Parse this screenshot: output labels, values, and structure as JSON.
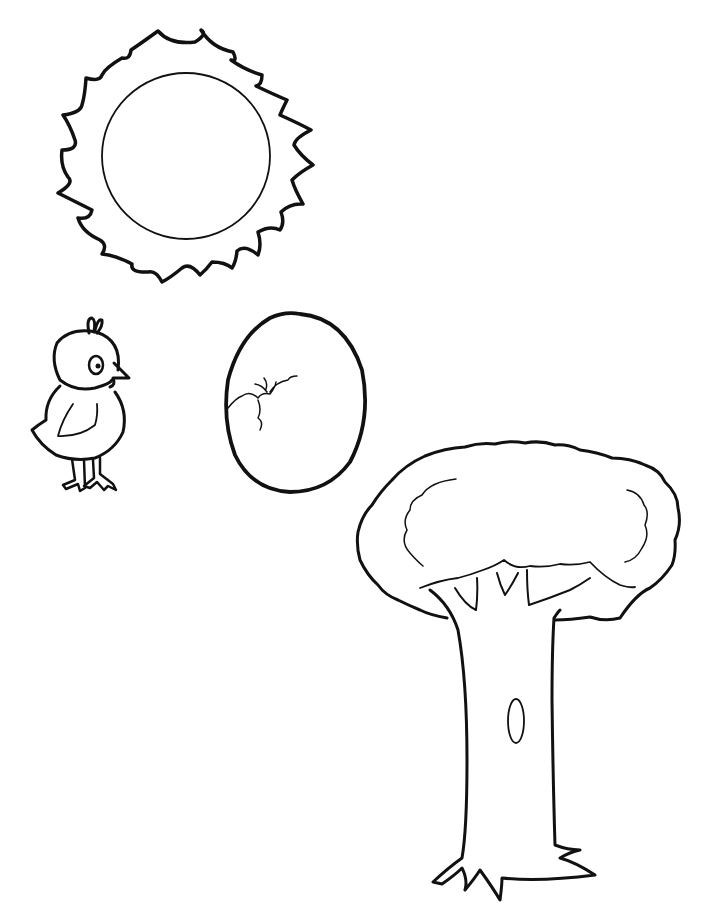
{
  "page": {
    "type": "coloring-page",
    "background": "#ffffff",
    "line_color": "#111111"
  },
  "figures": [
    {
      "id": "sun",
      "label": "sun",
      "rays": 22
    },
    {
      "id": "chick",
      "label": "chick"
    },
    {
      "id": "egg",
      "label": "cracked egg"
    },
    {
      "id": "tree",
      "label": "tree"
    }
  ]
}
